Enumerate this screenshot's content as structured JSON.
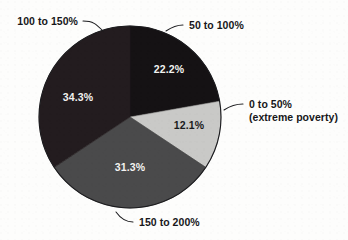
{
  "chart_data": {
    "type": "pie",
    "title": "",
    "subtitle": "",
    "xlabel": "",
    "ylabel": "",
    "legend_position": "callout-labels",
    "grid": false,
    "start_angle_deg": 0,
    "direction": "clockwise",
    "categories": [
      "50 to 100%",
      "0 to 50% (extreme poverty)",
      "150 to 200%",
      "100 to 150%"
    ],
    "values": [
      22.2,
      12.1,
      31.3,
      34.3
    ],
    "value_labels": [
      "22.2%",
      "12.1%",
      "31.3%",
      "34.3%"
    ],
    "colors": [
      "#151214",
      "#c9c9c7",
      "#4a4a4b",
      "#231c1f"
    ],
    "slices": [
      {
        "label": "50 to 100%",
        "value": 22.2,
        "value_label": "22.2%",
        "color": "#151214",
        "value_text_color": "#f2f2f0",
        "callout_lines": [
          "50 to 100%"
        ],
        "callout_anchor": "start"
      },
      {
        "label": "0 to 50% (extreme poverty)",
        "value": 12.1,
        "value_label": "12.1%",
        "color": "#c9c9c7",
        "value_text_color": "#1a1a1c",
        "callout_lines": [
          "0 to 50%",
          "(extreme poverty)"
        ],
        "callout_anchor": "start"
      },
      {
        "label": "150 to 200%",
        "value": 31.3,
        "value_label": "31.3%",
        "color": "#4a4a4b",
        "value_text_color": "#f3f3f1",
        "callout_lines": [
          "150 to 200%"
        ],
        "callout_anchor": "start"
      },
      {
        "label": "100 to 150%",
        "value": 34.3,
        "value_label": "34.3%",
        "color": "#231c1f",
        "value_text_color": "#f1f1ef",
        "callout_lines": [
          "100 to 150%"
        ],
        "callout_anchor": "end"
      }
    ]
  },
  "figure": {
    "background": "#fdfdfc",
    "outline_color": "#1b1b1e"
  },
  "callouts": {
    "top_left": {
      "line1": "100 to 150%"
    },
    "top_right": {
      "line1": "50 to 100%"
    },
    "right": {
      "line1": "0 to 50%",
      "line2": "(extreme poverty)"
    },
    "bottom": {
      "line1": "150 to 200%"
    }
  },
  "values": {
    "slice_a": "22.2%",
    "slice_b": "12.1%",
    "slice_c": "31.3%",
    "slice_d": "34.3%"
  }
}
